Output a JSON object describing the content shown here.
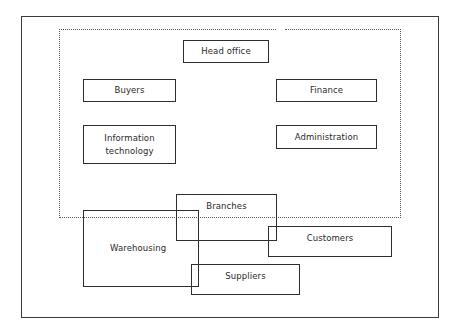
{
  "diagram": {
    "type": "organisation-boundary",
    "boundary_label": "",
    "inside_boundary": [
      {
        "id": "head-office",
        "label": "Head office"
      },
      {
        "id": "buyers",
        "label": "Buyers"
      },
      {
        "id": "finance",
        "label": "Finance"
      },
      {
        "id": "information-technology",
        "label": "Information\ntechnology"
      },
      {
        "id": "administration",
        "label": "Administration"
      }
    ],
    "straddling_boundary": [
      {
        "id": "branches",
        "label": "Branches"
      },
      {
        "id": "warehousing",
        "label": "Warehousing"
      }
    ],
    "outside_boundary": [
      {
        "id": "customers",
        "label": "Customers"
      },
      {
        "id": "suppliers",
        "label": "Suppliers"
      }
    ]
  }
}
